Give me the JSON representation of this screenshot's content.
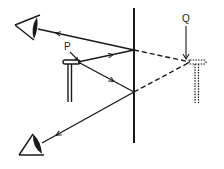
{
  "diagram": {
    "type": "plane-mirror-reflection",
    "labels": {
      "object_point": "P",
      "image_point": "Q"
    },
    "colors": {
      "stroke": "#1a1a1a",
      "background": "#ffffff"
    },
    "mirror": {
      "x": 134,
      "y_top": 8,
      "y_bottom": 143
    },
    "object": {
      "point": [
        76,
        62
      ]
    },
    "image": {
      "point": [
        192,
        62
      ]
    },
    "reflection_points": [
      [
        134,
        50
      ],
      [
        134,
        92
      ]
    ],
    "eyes": [
      {
        "name": "upper-eye",
        "position": [
          28,
          30
        ]
      },
      {
        "name": "lower-eye",
        "position": [
          26,
          150
        ]
      }
    ]
  }
}
